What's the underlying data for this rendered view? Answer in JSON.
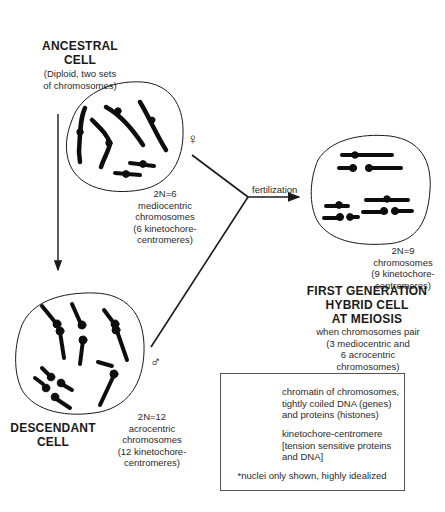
{
  "ancestral_cell": {
    "title_line1": "ANCESTRAL",
    "title_line2": "CELL",
    "subtitle_line1": "(Diploid, two sets",
    "subtitle_line2": "of chromosomes)",
    "symbol": "♀",
    "symbol_name": "female-symbol",
    "caption": [
      "2N=6",
      "mediocentric",
      "chromosomes",
      "(6 kinetochore-",
      "centromeres)"
    ]
  },
  "descendant_cell": {
    "title_line1": "DESCENDANT",
    "title_line2": "CELL",
    "symbol": "♂",
    "symbol_name": "male-symbol",
    "caption": [
      "2N=12",
      "acrocentric",
      "chromosomes",
      "(12 kinetochore-",
      "centromeres)"
    ]
  },
  "fertilization": {
    "label": "fertilization"
  },
  "hybrid_cell": {
    "caption": [
      "2N=9",
      "chromosomes",
      "(9 kinetochore-",
      "centromeres)"
    ],
    "title_line1": "FIRST GENERATION",
    "title_line2": "HYBRID CELL",
    "title_line3": "AT MEIOSIS",
    "subtitle": [
      "when chromosomes pair",
      "(3 mediocentric and",
      "6 acrocentric",
      "chromosomes)"
    ]
  },
  "legend": {
    "chromatin": [
      "chromatin of chromosomes,",
      "tightly coiled DNA (genes)",
      "and proteins (histones)"
    ],
    "kinetochore": [
      "kinetochore-centromere",
      "[tension sensitive proteins",
      "and DNA]"
    ],
    "note": "*nuclei only shown, highly idealized"
  },
  "colors": {
    "ink": "#1a1a1a",
    "chromosome": "#111111",
    "background": "#ffffff",
    "legend_border": "#555555"
  }
}
